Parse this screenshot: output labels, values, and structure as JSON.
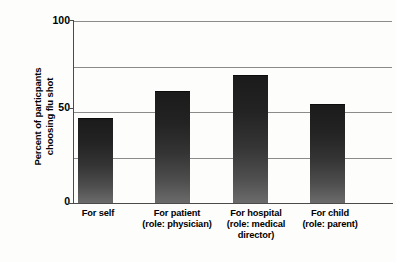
{
  "chart_data": {
    "type": "bar",
    "title": "",
    "xlabel": "",
    "ylabel": "Percent of particpants\nchoosing flu shot",
    "categories": [
      "For self",
      "For patient\n(role: physician)",
      "For hospital\n(role: medical\ndirector)",
      "For child\n(role: parent)"
    ],
    "values": [
      46,
      61,
      70,
      54
    ],
    "ylim": [
      0,
      100
    ],
    "ytick_labels": [
      "0",
      "50",
      "100"
    ],
    "ytick_values": [
      0,
      50,
      100
    ],
    "gridlines": [
      25,
      50,
      75,
      100
    ],
    "grid": true,
    "legend": null,
    "bar_color": "#2b2b2b",
    "grid_color": "#8b8b8b",
    "axis_color": "#4a4a4a",
    "background": "#fdfdfc"
  },
  "axis": {
    "y_title_line1": "Percent of particpants",
    "y_title_line2": "choosing flu shot",
    "y_max_label": "100",
    "y_mid_label": "50",
    "y_min_label": "0"
  },
  "categories": {
    "c0_line1": "For self",
    "c0_line2": "",
    "c0_line3": "",
    "c1_line1": "For patient",
    "c1_line2": "(role: physician)",
    "c1_line3": "",
    "c2_line1": "For hospital",
    "c2_line2": "(role: medical",
    "c2_line3": "director)",
    "c3_line1": "For child",
    "c3_line2": "(role: parent)",
    "c3_line3": ""
  }
}
